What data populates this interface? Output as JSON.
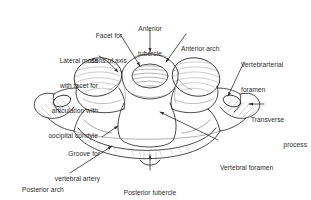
{
  "figure": {
    "background_color": "#ffffff",
    "ink_color": "#2b2b2b",
    "shading_color": "#8c8c8c"
  },
  "labels": {
    "lateral_mass": {
      "id": "lateral-mass",
      "lines": [
        "Lateral mass",
        "with facet for",
        "articulation with",
        "oocipital condyle"
      ],
      "align": "right"
    },
    "facet_dens": {
      "id": "facet-for-dens-of-axis",
      "lines": [
        "Facet for",
        "dens of axis"
      ],
      "align": "center"
    },
    "anterior_tubercle": {
      "id": "anterior-tubercle",
      "lines": [
        "Anterior",
        "tubercle"
      ],
      "align": "center"
    },
    "anterior_arch": {
      "id": "anterior-arch",
      "lines": [
        "Anterior arch"
      ],
      "align": "left"
    },
    "vertebrarterial_foramen": {
      "id": "vertebrarterial-foramen",
      "lines": [
        "Vertebrarterial",
        "foramen"
      ],
      "align": "left"
    },
    "transverse_process": {
      "id": "transverse-process",
      "lines": [
        "Transverse",
        "process"
      ],
      "align": "right"
    },
    "vertebral_foramen": {
      "id": "vertebral-foramen",
      "lines": [
        "Vertebral foramen"
      ],
      "align": "left"
    },
    "groove_vertebral_artery": {
      "id": "groove-for-vertebral-artery",
      "lines": [
        "Groove for",
        "vertebral artery"
      ],
      "align": "right"
    },
    "posterior_arch": {
      "id": "posterior-arch",
      "lines": [
        "Posterior arch"
      ],
      "align": "left"
    },
    "posterior_tubercle": {
      "id": "posterior-tubercle",
      "lines": [
        "Posterior tubercle"
      ],
      "align": "center"
    }
  }
}
